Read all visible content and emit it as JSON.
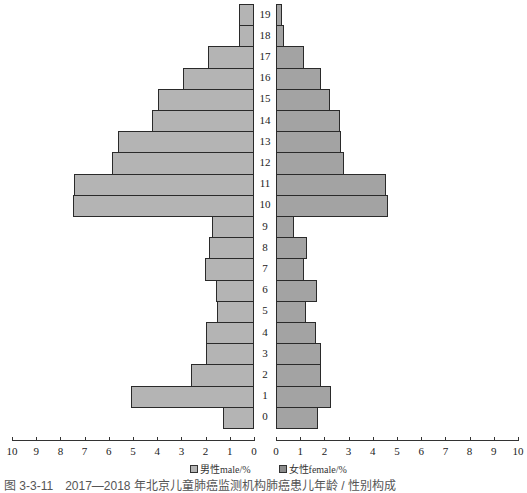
{
  "chart_data": {
    "type": "bar",
    "subtype": "population-pyramid",
    "title": "",
    "categories": [
      "0",
      "1",
      "2",
      "3",
      "4",
      "5",
      "6",
      "7",
      "8",
      "9",
      "10",
      "11",
      "12",
      "13",
      "14",
      "15",
      "16",
      "17",
      "18",
      "19"
    ],
    "series": [
      {
        "name": "男性male/%",
        "side": "left",
        "color": "#b4b4b4",
        "values": [
          1.27,
          5.09,
          2.59,
          1.97,
          1.99,
          1.53,
          1.56,
          2.03,
          1.86,
          1.74,
          7.48,
          7.43,
          5.88,
          5.62,
          4.21,
          3.97,
          2.92,
          1.9,
          0.63,
          0.63
        ]
      },
      {
        "name": "女性female/%",
        "side": "right",
        "color": "#a3a3a3",
        "values": [
          1.73,
          2.27,
          1.87,
          1.85,
          1.65,
          1.23,
          1.69,
          1.17,
          1.29,
          0.76,
          4.61,
          4.56,
          2.83,
          2.68,
          2.64,
          2.23,
          1.84,
          1.16,
          0.32,
          0.25
        ]
      }
    ],
    "xlabel": "",
    "ylabel": "",
    "xlim": [
      0,
      10
    ],
    "x_ticks": [
      "10",
      "9",
      "8",
      "7",
      "6",
      "5",
      "4",
      "3",
      "2",
      "1",
      "0",
      "0",
      "1",
      "2",
      "3",
      "4",
      "5",
      "6",
      "7",
      "8",
      "9",
      "10"
    ],
    "grid": false,
    "legend_position": "bottom"
  },
  "legend": {
    "male": "男性male/%",
    "female": "女性female/%"
  },
  "caption": "图 3-3-11　2017—2018 年北京儿童肺癌监测机构肺癌患儿年龄 / 性别构成"
}
